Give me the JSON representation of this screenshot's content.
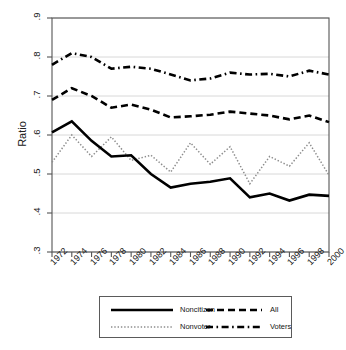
{
  "chart_data": {
    "type": "line",
    "title": "",
    "xlabel": "",
    "ylabel": "Ratio",
    "xlim": [
      1972,
      2000
    ],
    "ylim": [
      0.3,
      0.9
    ],
    "grid": true,
    "legend_position": "bottom",
    "categories": [
      1972,
      1974,
      1976,
      1978,
      1980,
      1982,
      1984,
      1986,
      1988,
      1990,
      1992,
      1994,
      1996,
      1998,
      2000
    ],
    "x_tick_labels": [
      "1972",
      "1974",
      "1976",
      "1978",
      "1980",
      "1982",
      "1984",
      "1986",
      "1988",
      "1990",
      "1992",
      "1994",
      "1996",
      "1998",
      "2000"
    ],
    "y_tick_labels": [
      ".9",
      ".8",
      ".7",
      ".6",
      ".5",
      ".4",
      ".3"
    ],
    "y_tick_values": [
      0.9,
      0.8,
      0.7,
      0.6,
      0.5,
      0.4,
      0.3
    ],
    "series": [
      {
        "name": "Noncitizen",
        "style": "solid",
        "color": "#000000",
        "width": 2.6,
        "values": [
          0.607,
          0.635,
          0.585,
          0.545,
          0.548,
          0.5,
          0.465,
          0.475,
          0.48,
          0.489,
          0.44,
          0.45,
          0.432,
          0.447,
          0.444
        ]
      },
      {
        "name": "All",
        "style": "dashed",
        "color": "#000000",
        "width": 2.6,
        "values": [
          0.69,
          0.72,
          0.7,
          0.67,
          0.678,
          0.665,
          0.645,
          0.648,
          0.652,
          0.66,
          0.655,
          0.65,
          0.64,
          0.65,
          0.633
        ]
      },
      {
        "name": "Nonvoter",
        "style": "dotted",
        "color": "#8c8c8c",
        "width": 1.5,
        "values": [
          0.53,
          0.6,
          0.545,
          0.595,
          0.535,
          0.548,
          0.505,
          0.58,
          0.525,
          0.57,
          0.475,
          0.545,
          0.52,
          0.58,
          0.497
        ]
      },
      {
        "name": "Voters",
        "style": "dashdot",
        "color": "#000000",
        "width": 2.6,
        "values": [
          0.78,
          0.81,
          0.8,
          0.77,
          0.775,
          0.77,
          0.755,
          0.74,
          0.745,
          0.76,
          0.755,
          0.757,
          0.75,
          0.765,
          0.755
        ]
      }
    ]
  },
  "legend": {
    "entries": [
      {
        "label": "Noncitizen",
        "style": "solid"
      },
      {
        "label": "All",
        "style": "dashed"
      },
      {
        "label": "Nonvoter",
        "style": "dotted"
      },
      {
        "label": "Voters",
        "style": "dashdot"
      }
    ]
  },
  "colors": {
    "axis": "#555555",
    "grid": "#d8d8d8",
    "ink": "#000000",
    "muted": "#8c8c8c",
    "background": "#ffffff"
  }
}
